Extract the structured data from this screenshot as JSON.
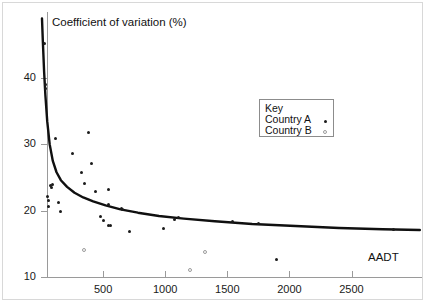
{
  "chart_data": {
    "type": "scatter",
    "title": "",
    "xlabel": "AADT",
    "ylabel": "Coefficient of variation (%)",
    "xlim": [
      0,
      3060
    ],
    "ylim": [
      9,
      49
    ],
    "grid": false,
    "legend_position": "upper-right",
    "legend_title": "Key",
    "x_ticks": [
      500,
      1000,
      1500,
      2000,
      2500
    ],
    "x_tick_labels": [
      "500",
      "1000",
      "1500",
      "2000",
      "2500"
    ],
    "y_ticks": [
      10,
      20,
      30,
      40
    ],
    "y_tick_labels": [
      "10",
      "20",
      "30",
      "40"
    ],
    "series": [
      {
        "name": "Country A",
        "marker": "filled-dot",
        "color": "#1b1b1b",
        "points": [
          [
            30,
            45.2
          ],
          [
            35,
            39.0
          ],
          [
            38,
            38.5
          ],
          [
            120,
            30.9
          ],
          [
            75,
            23.8
          ],
          [
            90,
            23.9
          ],
          [
            85,
            23.5
          ],
          [
            55,
            22.2
          ],
          [
            58,
            21.5
          ],
          [
            140,
            21.3
          ],
          [
            62,
            20.7
          ],
          [
            160,
            19.9
          ],
          [
            255,
            28.6
          ],
          [
            380,
            31.8
          ],
          [
            330,
            25.7
          ],
          [
            405,
            27.1
          ],
          [
            350,
            24.1
          ],
          [
            440,
            22.9
          ],
          [
            545,
            23.2
          ],
          [
            540,
            21.0
          ],
          [
            650,
            20.3
          ],
          [
            660,
            20.2
          ],
          [
            480,
            19.2
          ],
          [
            505,
            18.5
          ],
          [
            545,
            17.8
          ],
          [
            560,
            17.7
          ],
          [
            715,
            16.9
          ],
          [
            985,
            17.3
          ],
          [
            1075,
            18.6
          ],
          [
            1105,
            18.9
          ],
          [
            1545,
            18.3
          ],
          [
            1755,
            18.0
          ],
          [
            1900,
            12.7
          ],
          [
            2840,
            17.1
          ]
        ]
      },
      {
        "name": "Country B",
        "marker": "open-dot",
        "color": "#9b9b9b",
        "points": [
          [
            345,
            14.0
          ],
          [
            1320,
            13.7
          ],
          [
            1200,
            11.0
          ]
        ]
      }
    ],
    "fitted_curve": {
      "description": "decaying power-law fit through the scatter",
      "visible": true,
      "color": "#101010",
      "points": [
        [
          8,
          49.0
        ],
        [
          15,
          45.5
        ],
        [
          25,
          41.0
        ],
        [
          35,
          37.5
        ],
        [
          50,
          33.5
        ],
        [
          70,
          30.0
        ],
        [
          95,
          27.5
        ],
        [
          125,
          25.8
        ],
        [
          160,
          24.6
        ],
        [
          210,
          23.6
        ],
        [
          270,
          22.7
        ],
        [
          340,
          22.0
        ],
        [
          420,
          21.4
        ],
        [
          520,
          20.8
        ],
        [
          640,
          20.2
        ],
        [
          780,
          19.7
        ],
        [
          950,
          19.2
        ],
        [
          1150,
          18.8
        ],
        [
          1400,
          18.4
        ],
        [
          1700,
          18.0
        ],
        [
          2050,
          17.7
        ],
        [
          2400,
          17.4
        ],
        [
          2750,
          17.2
        ],
        [
          3050,
          17.1
        ]
      ]
    }
  },
  "legend": {
    "title": "Key",
    "entries": [
      {
        "label": "Country A",
        "marker": "filled-dot"
      },
      {
        "label": "Country B",
        "marker": "open-dot"
      }
    ]
  },
  "axes": {
    "y_axis_title": "Coefficient of variation (%)",
    "x_axis_title": "AADT"
  }
}
